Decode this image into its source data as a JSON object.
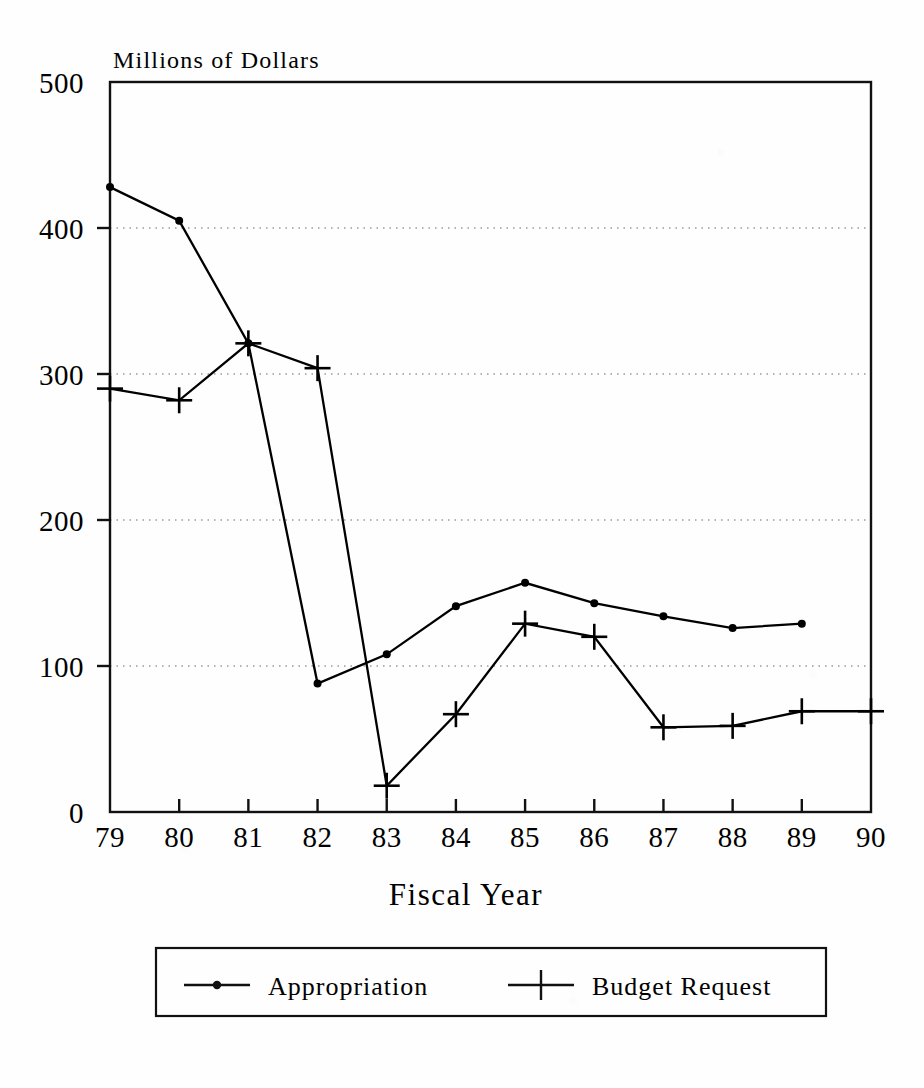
{
  "chart_data": {
    "type": "line",
    "title": "Millions of Dollars",
    "xlabel": "Fiscal Year",
    "ylabel": "Millions of Dollars",
    "categories": [
      "79",
      "80",
      "81",
      "82",
      "83",
      "84",
      "85",
      "86",
      "87",
      "88",
      "89",
      "90"
    ],
    "x": [
      79,
      80,
      81,
      82,
      83,
      84,
      85,
      86,
      87,
      88,
      89,
      90
    ],
    "xlim": [
      79,
      90
    ],
    "ylim": [
      0,
      500
    ],
    "xticks": [
      "79",
      "80",
      "81",
      "82",
      "83",
      "84",
      "85",
      "86",
      "87",
      "88",
      "89",
      "90"
    ],
    "yticks": [
      "0",
      "100",
      "200",
      "300",
      "400",
      "500"
    ],
    "grid": "horizontal-dotted",
    "legend_position": "bottom",
    "series": [
      {
        "name": "Appropriation",
        "marker": "dot",
        "color": "#000000",
        "x": [
          79,
          80,
          81,
          82,
          83,
          84,
          85,
          86,
          87,
          88,
          89
        ],
        "values": [
          428,
          405,
          321,
          88,
          108,
          141,
          157,
          143,
          134,
          126,
          129
        ]
      },
      {
        "name": "Budget Request",
        "marker": "plus",
        "color": "#000000",
        "x": [
          79,
          80,
          81,
          82,
          83,
          84,
          85,
          86,
          87,
          88,
          89,
          90
        ],
        "values": [
          290,
          282,
          321,
          304,
          18,
          67,
          129,
          120,
          58,
          59,
          69,
          69
        ]
      }
    ]
  },
  "legend": {
    "items": [
      {
        "label": "Appropriation",
        "marker": "dot"
      },
      {
        "label": "Budget Request",
        "marker": "plus"
      }
    ]
  },
  "colors": {
    "ink": "#111111",
    "grid": "#9a9a9a",
    "paper": "#fefefe"
  }
}
